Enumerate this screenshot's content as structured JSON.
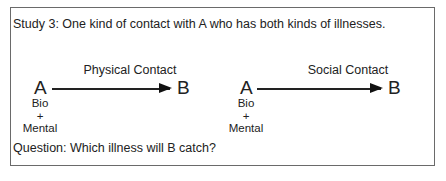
{
  "title": "Study 3: One kind of contact with A who has both kinds of illnesses.",
  "left_panel": {
    "contact_label": "Physical Contact",
    "source": "A",
    "target": "B",
    "source_attributes": [
      "Bio",
      "+",
      "Mental"
    ]
  },
  "right_panel": {
    "contact_label": "Social Contact",
    "source": "A",
    "target": "B",
    "source_attributes": [
      "Bio",
      "+",
      "Mental"
    ]
  },
  "question": "Question: Which illness will B catch?"
}
